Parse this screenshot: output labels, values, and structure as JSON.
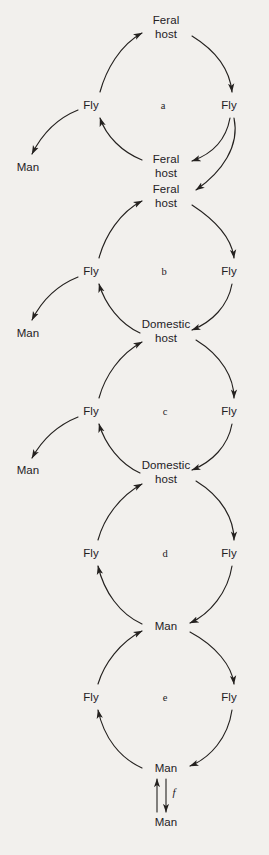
{
  "figure": {
    "type": "cycle-diagram",
    "background_color": "#f2f0ed",
    "ink_color": "#24211f"
  },
  "nodes": [
    {
      "id": "n1",
      "label": "Feral\nhost",
      "x": 166,
      "y": 27
    },
    {
      "id": "n2",
      "label": "Fly",
      "x": 91,
      "y": 105
    },
    {
      "id": "n3",
      "label": "Fly",
      "x": 229,
      "y": 105
    },
    {
      "id": "n4",
      "label": "Man",
      "x": 28,
      "y": 167
    },
    {
      "id": "n5",
      "label": "Feral\nhost",
      "x": 166,
      "y": 166
    },
    {
      "id": "n6",
      "label": "Feral\nhost",
      "x": 166,
      "y": 196
    },
    {
      "id": "n7",
      "label": "Fly",
      "x": 91,
      "y": 271
    },
    {
      "id": "n8",
      "label": "Fly",
      "x": 229,
      "y": 271
    },
    {
      "id": "n9",
      "label": "Man",
      "x": 28,
      "y": 333
    },
    {
      "id": "n10",
      "label": "Domestic\nhost",
      "x": 166,
      "y": 331
    },
    {
      "id": "n11",
      "label": "Fly",
      "x": 91,
      "y": 411
    },
    {
      "id": "n12",
      "label": "Fly",
      "x": 229,
      "y": 411
    },
    {
      "id": "n13",
      "label": "Man",
      "x": 28,
      "y": 470
    },
    {
      "id": "n14",
      "label": "Domestic\nhost",
      "x": 166,
      "y": 472
    },
    {
      "id": "n15",
      "label": "Fly",
      "x": 91,
      "y": 553
    },
    {
      "id": "n16",
      "label": "Fly",
      "x": 229,
      "y": 553
    },
    {
      "id": "n17",
      "label": "Man",
      "x": 166,
      "y": 626
    },
    {
      "id": "n18",
      "label": "Fly",
      "x": 91,
      "y": 697
    },
    {
      "id": "n19",
      "label": "Fly",
      "x": 229,
      "y": 697
    },
    {
      "id": "n20",
      "label": "Man",
      "x": 166,
      "y": 768
    },
    {
      "id": "n21",
      "label": "Man",
      "x": 166,
      "y": 822
    }
  ],
  "cycle_letters": [
    {
      "id": "a",
      "label": "a",
      "x": 163,
      "y": 105
    },
    {
      "id": "b",
      "label": "b",
      "x": 164,
      "y": 271
    },
    {
      "id": "c",
      "label": "c",
      "x": 165,
      "y": 411
    },
    {
      "id": "d",
      "label": "d",
      "x": 165,
      "y": 553
    },
    {
      "id": "e",
      "label": "e",
      "x": 165,
      "y": 697
    }
  ],
  "edge_letters": [
    {
      "id": "f",
      "label": "f",
      "x": 174,
      "y": 792
    }
  ],
  "arrows": [
    {
      "name": "feral-host-to-fly-right-a",
      "d": "M 192 36 C 218 52 230 72 232 92",
      "arrow": true
    },
    {
      "name": "fly-right-to-feral-host-a",
      "d": "M 230 118 C 226 140 212 154 192 161",
      "arrow": true
    },
    {
      "name": "feral-host-to-fly-left-a",
      "d": "M 142 160 C 122 152 106 136 100 118",
      "arrow": true
    },
    {
      "name": "fly-left-to-feral-host-a",
      "d": "M 100 92 C 106 70 120 45 142 33",
      "arrow": true
    },
    {
      "name": "fly-left-to-man-a",
      "d": "M 78 110 C 58 118 42 134 32 154",
      "arrow": true
    },
    {
      "name": "fly-right-to-feral-host-b",
      "d": "M 234 118 C 240 146 222 172 196 190",
      "arrow": true
    },
    {
      "name": "feral-host-to-fly-right-b",
      "d": "M 192 205 C 218 222 232 240 234 258",
      "arrow": true
    },
    {
      "name": "fly-right-to-domestic-host-b",
      "d": "M 232 284 C 228 306 212 322 192 330",
      "arrow": true
    },
    {
      "name": "domestic-host-to-fly-left-b",
      "d": "M 140 333 C 120 324 105 304 99 284",
      "arrow": true
    },
    {
      "name": "fly-left-to-feral-host-b",
      "d": "M 99 258 C 105 236 120 212 142 201",
      "arrow": true
    },
    {
      "name": "fly-left-to-man-b",
      "d": "M 78 277 C 58 285 42 300 32 320",
      "arrow": true
    },
    {
      "name": "domestic-host-to-fly-right-c",
      "d": "M 196 340 C 222 356 234 378 234 398",
      "arrow": true
    },
    {
      "name": "fly-right-to-domestic-host-c",
      "d": "M 232 424 C 228 446 212 462 192 470",
      "arrow": true
    },
    {
      "name": "domestic-host-to-fly-left-c",
      "d": "M 140 473 C 120 464 105 444 99 424",
      "arrow": true
    },
    {
      "name": "fly-left-to-domestic-host-c",
      "d": "M 99 398 C 105 376 120 354 142 342",
      "arrow": true
    },
    {
      "name": "fly-left-to-man-c",
      "d": "M 78 417 C 58 425 42 440 32 458",
      "arrow": true
    },
    {
      "name": "domestic-host-to-fly-right-d",
      "d": "M 196 481 C 222 497 234 519 234 540",
      "arrow": true
    },
    {
      "name": "fly-right-to-man-d",
      "d": "M 232 566 C 228 592 210 614 190 623",
      "arrow": true
    },
    {
      "name": "man-to-fly-left-d",
      "d": "M 142 624 C 120 614 104 592 98 566",
      "arrow": true
    },
    {
      "name": "fly-left-to-domestic-host-d",
      "d": "M 98 540 C 104 518 120 496 142 484",
      "arrow": true
    },
    {
      "name": "man-to-fly-right-e",
      "d": "M 190 632 C 216 646 232 666 234 684",
      "arrow": true
    },
    {
      "name": "fly-right-to-man-e",
      "d": "M 232 710 C 228 738 210 758 190 766",
      "arrow": true
    },
    {
      "name": "man-to-fly-left-e",
      "d": "M 142 768 C 120 758 104 738 98 710",
      "arrow": true
    },
    {
      "name": "fly-left-to-man-e",
      "d": "M 98 684 C 104 664 120 642 142 631",
      "arrow": true
    },
    {
      "name": "man-to-man-up-f",
      "d": "M 157 812 L 157 779",
      "arrow": true
    },
    {
      "name": "man-to-man-down-f",
      "d": "M 166 779 L 166 812",
      "arrow": true
    }
  ]
}
